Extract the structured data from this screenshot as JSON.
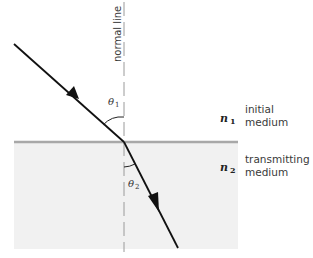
{
  "diagram": {
    "normal_line": {
      "label": "normal line"
    },
    "upper_medium": {
      "index_symbol": "n",
      "index_subscript": "1",
      "label_line1": "initial",
      "label_line2": "medium"
    },
    "lower_medium": {
      "index_symbol": "n",
      "index_subscript": "2",
      "label_line1": "transmitting",
      "label_line2": "medium",
      "fill_color": "#f1f1f1"
    },
    "interface": {
      "color": "#a8a8a8"
    },
    "incident_angle": {
      "symbol": "θ",
      "subscript": "1"
    },
    "refracted_angle": {
      "symbol": "θ",
      "subscript": "2"
    },
    "ray_color": "#111111"
  }
}
